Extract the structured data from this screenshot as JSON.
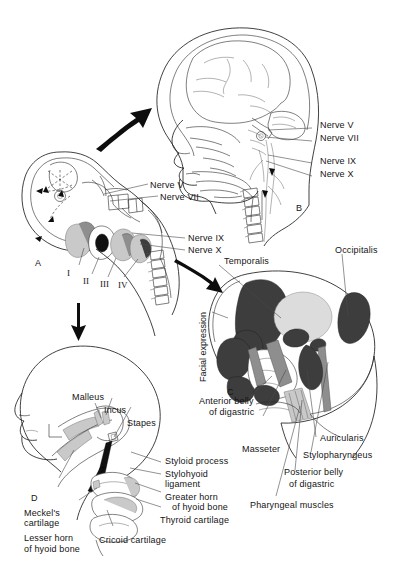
{
  "figure": {
    "panels": [
      {
        "id": "A",
        "letter": "A",
        "caption": "Embryo with pharyngeal arches"
      },
      {
        "id": "B",
        "letter": "B",
        "caption": "Adult head, cranial nerve courses"
      },
      {
        "id": "C",
        "letter": "C",
        "caption": "Muscles derived from pharyngeal arches"
      },
      {
        "id": "D",
        "letter": "D",
        "caption": "Skeletal derivatives of pharyngeal arches"
      }
    ]
  },
  "panel_a": {
    "letter": "A",
    "nerve_labels": [
      {
        "text": "Nerve V"
      },
      {
        "text": "Nerve VII"
      },
      {
        "text": "Nerve IX"
      },
      {
        "text": "Nerve X"
      }
    ],
    "arch_numerals": [
      "I",
      "II",
      "III",
      "IV"
    ]
  },
  "panel_b": {
    "letter": "B",
    "nerve_labels": [
      {
        "text": "Nerve V"
      },
      {
        "text": "Nerve VII"
      },
      {
        "text": "Nerve IX"
      },
      {
        "text": "Nerve X"
      }
    ]
  },
  "panel_c": {
    "letter": "C",
    "group_label": "Facial expression",
    "labels": [
      {
        "text": "Temporalis"
      },
      {
        "text": "Occipitalis"
      },
      {
        "text": "Anterior belly"
      },
      {
        "text": "of digastric"
      },
      {
        "text": "Masseter"
      },
      {
        "text": "Auricularis"
      },
      {
        "text": "Stylopharyngeus"
      },
      {
        "text": "Posterior belly"
      },
      {
        "text": "of digastric"
      },
      {
        "text": "Pharyngeal muscles"
      }
    ],
    "colors": {
      "arch1_muscle": "#3d3d3d",
      "arch2_muscle": "#8e8e8e",
      "arch3_muscle": "#c9c9c9",
      "bone": "#ffffff"
    }
  },
  "panel_d": {
    "letter": "D",
    "labels": [
      {
        "text": "Malleus"
      },
      {
        "text": "Incus"
      },
      {
        "text": "Stapes"
      },
      {
        "text": "Styloid process"
      },
      {
        "text": "Stylohyoid"
      },
      {
        "text": "ligament"
      },
      {
        "text": "Greater horn"
      },
      {
        "text": "of hyoid bone"
      },
      {
        "text": "Thyroid cartilage"
      },
      {
        "text": "Meckel's"
      },
      {
        "text": "cartilage"
      },
      {
        "text": "Lesser horn"
      },
      {
        "text": "of hyoid bone"
      },
      {
        "text": "Cricoid cartilage"
      }
    ]
  }
}
